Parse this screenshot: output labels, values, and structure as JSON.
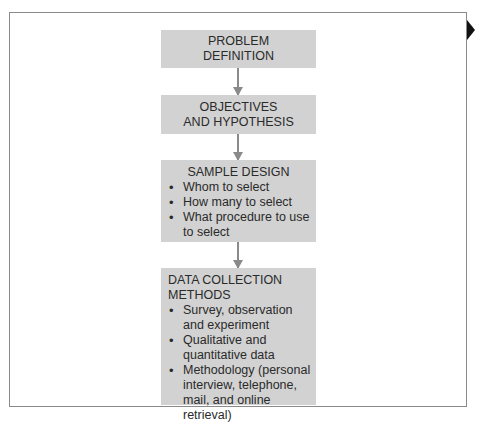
{
  "diagram": {
    "type": "flowchart",
    "direction": "top-to-bottom",
    "nodes": [
      {
        "id": "problem",
        "lines": [
          "PROBLEM",
          "DEFINITION"
        ]
      },
      {
        "id": "objectives",
        "lines": [
          "OBJECTIVES",
          "AND HYPOTHESIS"
        ]
      },
      {
        "id": "sample",
        "title": "SAMPLE DESIGN",
        "bullets": [
          "Whom to select",
          "How many to select",
          "What procedure to use to select"
        ]
      },
      {
        "id": "data",
        "title": "DATA COLLECTION METHODS",
        "bullets": [
          "Survey, observation and experiment",
          "Qualitative and quantitative data",
          "Methodology (personal interview, telephone, mail, and online retrieval)"
        ]
      }
    ],
    "edges": [
      {
        "from": "problem",
        "to": "objectives"
      },
      {
        "from": "objectives",
        "to": "sample"
      },
      {
        "from": "sample",
        "to": "data"
      }
    ],
    "colors": {
      "box_fill": "#d2d2d2",
      "arrow": "#8a8a8a",
      "frame": "#8a8a8a",
      "marker": "#111111"
    }
  }
}
